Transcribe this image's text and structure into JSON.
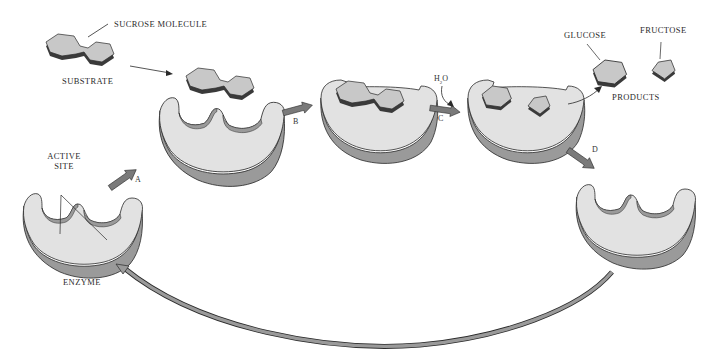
{
  "figure": {
    "colors": {
      "enzyme_top": "#e2e2e2",
      "enzyme_side": "#9a9a9a",
      "molecule_top": "#c8c8c8",
      "molecule_side": "#3a3a3a",
      "arrow_fill": "#7a7a7a",
      "outline": "#2a2a2a",
      "background": "#ffffff"
    }
  },
  "labels": {
    "sucrose_molecule": "SUCROSE MOLECULE",
    "substrate": "SUBSTRATE",
    "active_site_line1": "ACTIVE",
    "active_site_line2": "SITE",
    "enzyme": "ENZYME",
    "glucose": "GLUCOSE",
    "fructose": "FRUCTOSE",
    "products": "PRODUCTS",
    "water_h": "H",
    "water_sub": "2",
    "water_o": "O"
  },
  "steps": [
    {
      "id": "A",
      "label": "A"
    },
    {
      "id": "B",
      "label": "B"
    },
    {
      "id": "C",
      "label": "C"
    },
    {
      "id": "D",
      "label": "D"
    }
  ],
  "stages": [
    {
      "name": "free-enzyme",
      "description": "Enzyme with empty active site"
    },
    {
      "name": "substrate-approach",
      "description": "Sucrose approaches enzyme"
    },
    {
      "name": "enzyme-substrate-complex",
      "description": "Sucrose bound in active site"
    },
    {
      "name": "hydrolysis",
      "description": "Glucose and fructose in active site after H2O"
    },
    {
      "name": "enzyme-released",
      "description": "Enzyme free to repeat cycle"
    }
  ]
}
